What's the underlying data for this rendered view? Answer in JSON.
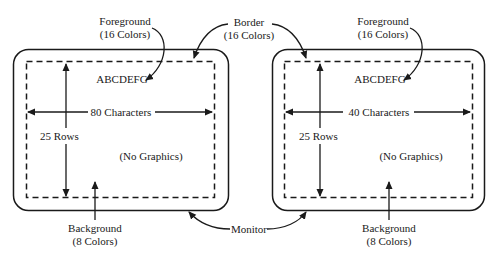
{
  "diagram": {
    "shared_labels": {
      "border": {
        "line1": "Border",
        "line2": "(16 Colors)"
      },
      "monitor": "Monitor"
    },
    "monitors": [
      {
        "foreground": {
          "line1": "Foreground",
          "line2": "(16 Colors)"
        },
        "sample_text": "ABCDEFG",
        "width_label": "80 Characters",
        "rows_label": "25 Rows",
        "graphics_label": "(No Graphics)",
        "background": {
          "line1": "Background",
          "line2": "(8 Colors)"
        }
      },
      {
        "foreground": {
          "line1": "Foreground",
          "line2": "(16 Colors)"
        },
        "sample_text": "ABCDEFG",
        "width_label": "40 Characters",
        "rows_label": "25 Rows",
        "graphics_label": "(No Graphics)",
        "background": {
          "line1": "Background",
          "line2": "(8 Colors)"
        }
      }
    ],
    "colors": {
      "line": "#1a1a1a",
      "background": "#ffffff"
    }
  }
}
